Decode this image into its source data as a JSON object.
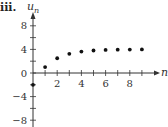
{
  "panel_label": "iii.",
  "chart_data": {
    "type": "scatter",
    "title": "",
    "xlabel": "n",
    "ylabel": "u",
    "ylabel_subscript": "n",
    "x": [
      0,
      1,
      2,
      3,
      4,
      5,
      6,
      7,
      8,
      9
    ],
    "series": [
      {
        "name": "u_n",
        "values": [
          -2,
          1,
          2.5,
          3.25,
          3.625,
          3.8125,
          3.906,
          3.953,
          3.977,
          3.988
        ]
      }
    ],
    "xlim": [
      0,
      10
    ],
    "ylim": [
      -10,
      10
    ],
    "x_ticks": [
      1,
      2,
      3,
      4,
      5,
      6,
      7,
      8,
      9
    ],
    "x_tick_labels": [
      "2",
      "4",
      "6",
      "8"
    ],
    "x_tick_label_values": [
      2,
      4,
      6,
      8
    ],
    "y_ticks": [
      -8,
      -6,
      -4,
      -2,
      0,
      2,
      4,
      6,
      8
    ],
    "y_tick_labels": [
      "8",
      "4",
      "0",
      "−4",
      "−8"
    ],
    "y_tick_label_values": [
      8,
      4,
      0,
      -4,
      -8
    ],
    "grid": false,
    "legend": "none",
    "marker_color": "#111111"
  }
}
